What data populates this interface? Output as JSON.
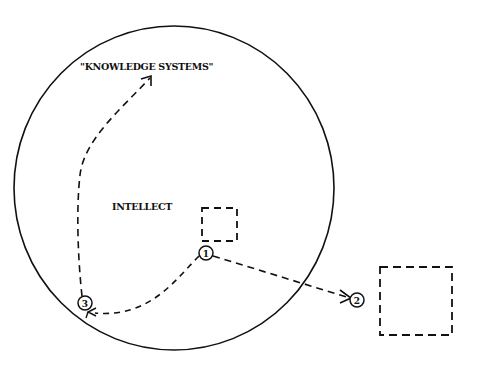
{
  "diagram": {
    "labels": {
      "knowledge_systems": "\"KNOWLEDGE SYSTEMS\"",
      "intellect": "INTELLECT"
    },
    "markers": [
      {
        "id": "marker-1",
        "label": "1"
      },
      {
        "id": "marker-2",
        "label": "2"
      },
      {
        "id": "marker-3",
        "label": "3"
      }
    ],
    "colors": {
      "stroke": "#111111",
      "background": "#ffffff"
    }
  }
}
